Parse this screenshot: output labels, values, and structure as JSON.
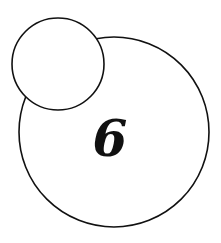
{
  "diagram": {
    "background": "#ffffff",
    "stroke_color": "#111111",
    "large_circle": {
      "cx": 114,
      "cy": 132,
      "r": 95,
      "label": "6"
    },
    "small_circle": {
      "cx": 58,
      "cy": 64,
      "r": 46,
      "label": ""
    },
    "digit": {
      "text": "6",
      "x": 110,
      "y": 156,
      "font_size": 50
    }
  }
}
